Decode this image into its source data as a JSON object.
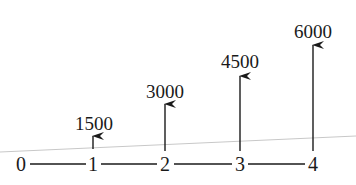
{
  "diagram": {
    "type": "cash-flow-timeline",
    "periods": [
      "0",
      "1",
      "2",
      "3",
      "4"
    ],
    "cash_flows": [
      {
        "period": "1",
        "amount": "1500"
      },
      {
        "period": "2",
        "amount": "3000"
      },
      {
        "period": "3",
        "amount": "4500"
      },
      {
        "period": "4",
        "amount": "6000"
      }
    ],
    "colors": {
      "ink": "#1a1a1a",
      "guide_line": "#c8c8c8",
      "background": "#ffffff"
    }
  }
}
